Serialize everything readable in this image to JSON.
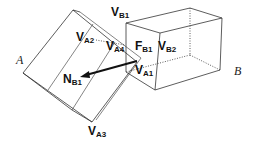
{
  "diagram": {
    "objects": [
      {
        "id": "A",
        "label": "A"
      },
      {
        "id": "B",
        "label": "B"
      }
    ],
    "labels": [
      {
        "id": "VB1",
        "main": "V",
        "sub": "B1"
      },
      {
        "id": "VA2",
        "main": "V",
        "sub": "A2"
      },
      {
        "id": "VA4",
        "main": "V",
        "sub": "A4"
      },
      {
        "id": "FB1",
        "main": "F",
        "sub": "B1"
      },
      {
        "id": "VB2",
        "main": "V",
        "sub": "B2"
      },
      {
        "id": "VA1",
        "main": "V",
        "sub": "A1"
      },
      {
        "id": "NB1",
        "main": "N",
        "sub": "B1"
      },
      {
        "id": "VA3",
        "main": "V",
        "sub": "A3"
      }
    ],
    "colors": {
      "line": "#333333",
      "arrow": "#111111",
      "background": "#ffffff"
    }
  }
}
